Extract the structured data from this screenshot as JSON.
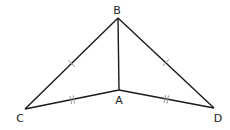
{
  "diagram": {
    "title": "",
    "points": {
      "A": {
        "label": "A",
        "x": 119,
        "y": 90,
        "label_x": 119,
        "label_y": 104
      },
      "B": {
        "label": "B",
        "x": 118,
        "y": 18,
        "label_x": 117,
        "label_y": 14
      },
      "C": {
        "label": "C",
        "x": 25,
        "y": 109,
        "label_x": 20,
        "label_y": 122
      },
      "D": {
        "label": "D",
        "x": 214,
        "y": 108,
        "label_x": 218,
        "label_y": 122
      }
    },
    "segments": [
      "BC",
      "BD",
      "BA",
      "CA",
      "AD"
    ],
    "congruence_marks": {
      "BC": 1,
      "BD": 1,
      "CA": 2,
      "AD": 2
    },
    "colors": {
      "line": "#1a1a1a",
      "tick": "#9a9a9a"
    }
  }
}
